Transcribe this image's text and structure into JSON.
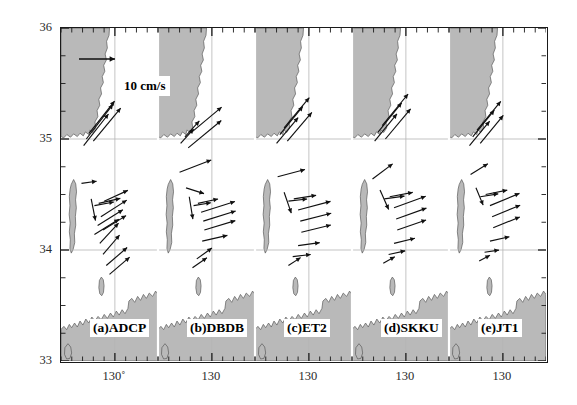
{
  "figure": {
    "kind": "multi-panel-vector-map",
    "n_panels": 5,
    "region": "Korea Strait / southern East Sea",
    "legend": {
      "label": "10 cm/s",
      "vector_cm_s": 10
    },
    "background_color": "#ffffff",
    "land_color": "#b9b9b9",
    "land_edge_color": "#5a5a5a",
    "vector_color": "#101010",
    "grid_color": "#b4b4b4",
    "axis_color": "#1a1a1a"
  },
  "axes": {
    "y": {
      "label": "",
      "ticks": [
        "36",
        "35",
        "34",
        "33"
      ],
      "values": [
        36,
        35,
        34,
        33
      ],
      "range": [
        33,
        36
      ],
      "minor_tick_interval": 0.25
    },
    "x": {
      "label": "",
      "panel_tick_labels": [
        "130˚",
        "130",
        "130",
        "130",
        "130"
      ],
      "per_panel_range": [
        129.0,
        130.8
      ],
      "tick_value": 130,
      "minor_tick_interval": 0.2
    },
    "gridlines": {
      "latitude": [
        35,
        34
      ],
      "longitude": [
        130
      ]
    }
  },
  "chart_data": {
    "type": "quiver",
    "title": "",
    "xlabel": "",
    "ylabel": "",
    "ylim": [
      33,
      36
    ],
    "xlim": [
      129.0,
      130.8
    ],
    "grid": true,
    "legend_position": "top-left-panel-a",
    "reference_vector": {
      "magnitude": 10,
      "units": "cm/s",
      "direction_deg": 90
    },
    "panels": [
      {
        "id": "a",
        "label": "(a)ADCP",
        "name": "ADCP",
        "vectors": [
          {
            "x": 129.52,
            "y": 35.05,
            "u": 7.1,
            "v": 9.0
          },
          {
            "x": 129.47,
            "y": 35.0,
            "u": 7.4,
            "v": 9.6
          },
          {
            "x": 129.42,
            "y": 34.94,
            "u": 6.9,
            "v": 8.8
          },
          {
            "x": 129.6,
            "y": 34.98,
            "u": 7.6,
            "v": 9.2
          },
          {
            "x": 129.38,
            "y": 34.6,
            "u": 4.2,
            "v": 0.6
          },
          {
            "x": 129.56,
            "y": 34.46,
            "u": 1.2,
            "v": -6.0
          },
          {
            "x": 129.62,
            "y": 34.4,
            "u": 5.4,
            "v": 1.0
          },
          {
            "x": 129.7,
            "y": 34.42,
            "u": 6.0,
            "v": 1.4
          },
          {
            "x": 129.8,
            "y": 34.44,
            "u": 6.6,
            "v": 3.0
          },
          {
            "x": 129.74,
            "y": 34.3,
            "u": 7.2,
            "v": 4.6
          },
          {
            "x": 129.68,
            "y": 34.22,
            "u": 7.0,
            "v": 4.4
          },
          {
            "x": 129.62,
            "y": 34.14,
            "u": 6.8,
            "v": 4.2
          },
          {
            "x": 129.78,
            "y": 34.18,
            "u": 6.4,
            "v": 4.0
          },
          {
            "x": 129.72,
            "y": 34.06,
            "u": 5.2,
            "v": 5.6
          },
          {
            "x": 129.78,
            "y": 33.96,
            "u": 4.6,
            "v": 5.4
          },
          {
            "x": 129.84,
            "y": 33.86,
            "u": 5.8,
            "v": 5.0
          },
          {
            "x": 129.9,
            "y": 33.78,
            "u": 5.6,
            "v": 4.8
          }
        ]
      },
      {
        "id": "b",
        "label": "(b)DBDB",
        "name": "DBDB",
        "vectors": [
          {
            "x": 129.5,
            "y": 35.02,
            "u": 4.0,
            "v": 4.4
          },
          {
            "x": 129.42,
            "y": 34.96,
            "u": 3.6,
            "v": 4.0
          },
          {
            "x": 129.62,
            "y": 35.06,
            "u": 8.4,
            "v": 7.0
          },
          {
            "x": 129.56,
            "y": 34.92,
            "u": 9.2,
            "v": 7.6
          },
          {
            "x": 129.4,
            "y": 34.7,
            "u": 8.8,
            "v": 3.4
          },
          {
            "x": 129.52,
            "y": 34.56,
            "u": 5.0,
            "v": -1.6
          },
          {
            "x": 129.58,
            "y": 34.48,
            "u": 1.0,
            "v": -6.2
          },
          {
            "x": 129.66,
            "y": 34.4,
            "u": 4.8,
            "v": 0.8
          },
          {
            "x": 129.74,
            "y": 34.42,
            "u": 5.6,
            "v": 1.2
          },
          {
            "x": 129.8,
            "y": 34.34,
            "u": 9.4,
            "v": 3.0
          },
          {
            "x": 129.84,
            "y": 34.26,
            "u": 9.0,
            "v": 2.8
          },
          {
            "x": 129.86,
            "y": 34.18,
            "u": 8.6,
            "v": 2.6
          },
          {
            "x": 129.82,
            "y": 34.08,
            "u": 7.0,
            "v": 1.6
          },
          {
            "x": 129.72,
            "y": 33.92,
            "u": 4.2,
            "v": 3.0
          },
          {
            "x": 129.64,
            "y": 33.84,
            "u": 4.0,
            "v": 2.8
          }
        ]
      },
      {
        "id": "c",
        "label": "(c)ET2",
        "name": "ET2",
        "vectors": [
          {
            "x": 129.46,
            "y": 35.04,
            "u": 6.4,
            "v": 7.8
          },
          {
            "x": 129.54,
            "y": 35.1,
            "u": 7.0,
            "v": 8.4
          },
          {
            "x": 129.4,
            "y": 34.96,
            "u": 6.0,
            "v": 7.2
          },
          {
            "x": 129.6,
            "y": 34.98,
            "u": 6.8,
            "v": 8.0
          },
          {
            "x": 129.42,
            "y": 34.66,
            "u": 7.6,
            "v": 2.0
          },
          {
            "x": 129.54,
            "y": 34.52,
            "u": 2.0,
            "v": -5.8
          },
          {
            "x": 129.62,
            "y": 34.44,
            "u": 5.2,
            "v": 0.6
          },
          {
            "x": 129.72,
            "y": 34.46,
            "u": 6.2,
            "v": 1.0
          },
          {
            "x": 129.8,
            "y": 34.36,
            "u": 9.0,
            "v": 2.4
          },
          {
            "x": 129.84,
            "y": 34.26,
            "u": 8.6,
            "v": 2.2
          },
          {
            "x": 129.86,
            "y": 34.16,
            "u": 8.2,
            "v": 2.0
          },
          {
            "x": 129.8,
            "y": 34.04,
            "u": 6.0,
            "v": 0.8
          },
          {
            "x": 129.7,
            "y": 33.94,
            "u": 5.0,
            "v": 0.6
          },
          {
            "x": 129.62,
            "y": 33.86,
            "u": 3.4,
            "v": 2.2
          }
        ]
      },
      {
        "id": "d",
        "label": "(d)SKKU",
        "name": "SKKU",
        "vectors": [
          {
            "x": 129.48,
            "y": 35.06,
            "u": 6.6,
            "v": 8.2
          },
          {
            "x": 129.56,
            "y": 35.12,
            "u": 7.2,
            "v": 8.8
          },
          {
            "x": 129.42,
            "y": 34.98,
            "u": 6.2,
            "v": 7.6
          },
          {
            "x": 129.62,
            "y": 35.0,
            "u": 7.0,
            "v": 8.4
          },
          {
            "x": 129.38,
            "y": 34.64,
            "u": 5.6,
            "v": 4.2
          },
          {
            "x": 129.52,
            "y": 34.54,
            "u": 2.4,
            "v": -5.4
          },
          {
            "x": 129.6,
            "y": 34.46,
            "u": 5.6,
            "v": 0.8
          },
          {
            "x": 129.7,
            "y": 34.48,
            "u": 6.4,
            "v": 1.2
          },
          {
            "x": 129.78,
            "y": 34.38,
            "u": 8.8,
            "v": 3.2
          },
          {
            "x": 129.82,
            "y": 34.28,
            "u": 8.4,
            "v": 3.0
          },
          {
            "x": 129.84,
            "y": 34.18,
            "u": 8.0,
            "v": 2.8
          },
          {
            "x": 129.78,
            "y": 34.06,
            "u": 5.8,
            "v": 1.4
          },
          {
            "x": 129.68,
            "y": 33.96,
            "u": 4.6,
            "v": 1.0
          },
          {
            "x": 129.58,
            "y": 33.88,
            "u": 3.2,
            "v": 1.8
          }
        ]
      },
      {
        "id": "e",
        "label": "(e)JT1",
        "name": "JT1",
        "vectors": [
          {
            "x": 129.44,
            "y": 35.02,
            "u": 6.0,
            "v": 7.4
          },
          {
            "x": 129.52,
            "y": 35.08,
            "u": 6.6,
            "v": 8.0
          },
          {
            "x": 129.38,
            "y": 34.94,
            "u": 5.6,
            "v": 6.8
          },
          {
            "x": 129.58,
            "y": 34.96,
            "u": 6.4,
            "v": 7.8
          },
          {
            "x": 129.4,
            "y": 34.68,
            "u": 4.8,
            "v": 3.0
          },
          {
            "x": 129.5,
            "y": 34.56,
            "u": 2.0,
            "v": -4.8
          },
          {
            "x": 129.58,
            "y": 34.48,
            "u": 5.0,
            "v": 0.8
          },
          {
            "x": 129.68,
            "y": 34.5,
            "u": 6.0,
            "v": 1.2
          },
          {
            "x": 129.76,
            "y": 34.4,
            "u": 8.2,
            "v": 3.4
          },
          {
            "x": 129.8,
            "y": 34.3,
            "u": 7.8,
            "v": 3.2
          },
          {
            "x": 129.82,
            "y": 34.2,
            "u": 7.4,
            "v": 3.0
          },
          {
            "x": 129.76,
            "y": 34.08,
            "u": 5.4,
            "v": 1.2
          },
          {
            "x": 129.66,
            "y": 33.98,
            "u": 4.0,
            "v": 0.6
          },
          {
            "x": 129.56,
            "y": 33.9,
            "u": 3.0,
            "v": 1.6
          }
        ]
      }
    ]
  }
}
